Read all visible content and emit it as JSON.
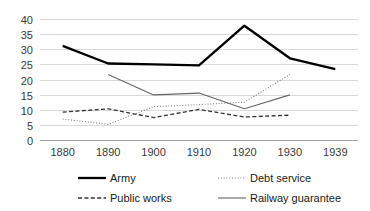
{
  "chart_data": {
    "type": "line",
    "title": "",
    "subtitle": "",
    "xlabel": "",
    "ylabel": "",
    "x": [
      "1880",
      "1890",
      "1900",
      "1910",
      "1920",
      "1930",
      "1939"
    ],
    "categories": [
      "1880",
      "1890",
      "1900",
      "1910",
      "1920",
      "1930",
      "1939"
    ],
    "xtick_labels": [
      "1880",
      "1890",
      "1900",
      "1910",
      "1920",
      "1930",
      "1939"
    ],
    "ytick_labels": [
      "0",
      "5",
      "10",
      "15",
      "20",
      "25",
      "30",
      "35",
      "40"
    ],
    "ylim": [
      0,
      40
    ],
    "ytick_step": 5,
    "grid": "horizontal",
    "legend_position": "bottom",
    "legend_columns": 2,
    "series": [
      {
        "name": "Army",
        "style": "solid-thick",
        "color": "#000000",
        "values": [
          31.1,
          25.3,
          25.0,
          24.7,
          37.8,
          27.0,
          23.4
        ]
      },
      {
        "name": "Debt service",
        "style": "dotted",
        "color": "#808080",
        "values": [
          6.9,
          5.2,
          11.0,
          11.7,
          12.5,
          21.7,
          null
        ]
      },
      {
        "name": "Public works",
        "style": "dashed",
        "color": "#333333",
        "values": [
          9.2,
          10.3,
          7.4,
          10.1,
          7.6,
          8.2,
          null
        ]
      },
      {
        "name": "Railway guarantee",
        "style": "solid-thin",
        "color": "#666666",
        "values": [
          null,
          21.7,
          14.9,
          15.5,
          10.3,
          14.9,
          null
        ]
      }
    ]
  },
  "legend": {
    "items": [
      {
        "label": "Army",
        "swatch": "solid-thick"
      },
      {
        "label": "Debt service",
        "swatch": "dotted"
      },
      {
        "label": "Public works",
        "swatch": "dashed"
      },
      {
        "label": "Railway guarantee",
        "swatch": "solid-thin"
      }
    ]
  },
  "colors": {
    "gridline": "#d9d9d9",
    "axis": "#a6a6a6",
    "text": "#3a3a3a",
    "army": "#000000",
    "debt_service": "#808080",
    "public_works": "#333333",
    "railway_guarantee": "#666666"
  }
}
